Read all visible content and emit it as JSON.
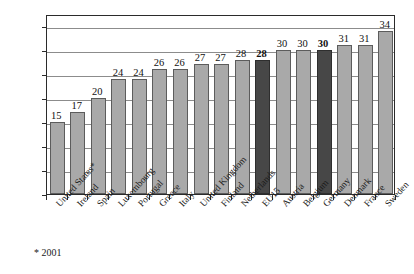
{
  "chart_data": {
    "type": "bar",
    "title": "",
    "subtitle": "",
    "xlabel": "",
    "ylabel": "",
    "ylim": [
      0,
      37.5
    ],
    "grid": true,
    "legend": false,
    "yticks": [
      0,
      5,
      10,
      15,
      20,
      25,
      30,
      35
    ],
    "ytick_labels": [
      "0",
      "5",
      "10",
      "15",
      "20",
      "25",
      "30",
      "35"
    ],
    "categories": [
      "United States*",
      "Ireland",
      "Spain",
      "Luxembourg",
      "Portugal",
      "Greece",
      "Italy",
      "United Kingdom",
      "Finland",
      "Netherlands",
      "EU15",
      "Austria",
      "Belgium",
      "Germany",
      "Denmark",
      "France",
      "Sweden"
    ],
    "values": [
      15,
      17,
      20,
      24,
      24,
      26,
      26,
      27,
      27,
      28,
      28,
      30,
      30,
      30,
      31,
      31,
      34
    ],
    "value_labels": [
      "15",
      "17",
      "20",
      "24",
      "24",
      "26",
      "26",
      "27",
      "27",
      "28",
      "28",
      "30",
      "30",
      "30",
      "31",
      "31",
      "34"
    ],
    "highlighted": [
      false,
      false,
      false,
      false,
      false,
      false,
      false,
      false,
      false,
      false,
      true,
      false,
      false,
      true,
      false,
      false,
      false
    ],
    "bar_colors": {
      "normal": "#a9a9a9",
      "highlight": "#474747",
      "border": "#5c5c5c"
    },
    "annotations": [
      "* 2001"
    ]
  },
  "footnote": "* 2001"
}
